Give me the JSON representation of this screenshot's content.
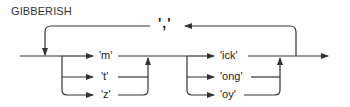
{
  "diagram": {
    "title": "GIBBERISH",
    "separator": {
      "label": "','"
    },
    "groups": [
      {
        "name": "prefix",
        "items": [
          {
            "label": "'m'"
          },
          {
            "label": "'t'"
          },
          {
            "label": "'z'"
          }
        ]
      },
      {
        "name": "suffix",
        "items": [
          {
            "label": "'ick'"
          },
          {
            "label": "'ong'"
          },
          {
            "label": "'oy'"
          }
        ]
      }
    ],
    "colors": {
      "line": "#333333",
      "background": "#ffffff",
      "text": "#222222"
    }
  }
}
